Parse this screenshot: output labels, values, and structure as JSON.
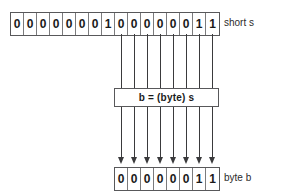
{
  "diagram": {
    "short_row": {
      "label": "short s",
      "bits": [
        "0",
        "0",
        "0",
        "0",
        "0",
        "0",
        "0",
        "1",
        "0",
        "0",
        "0",
        "0",
        "0",
        "0",
        "1",
        "1"
      ]
    },
    "cast_box": {
      "expression": "b = (byte) s"
    },
    "byte_row": {
      "label": "byte b",
      "bits": [
        "0",
        "0",
        "0",
        "0",
        "0",
        "0",
        "1",
        "1"
      ]
    },
    "connectors": {
      "count": 8,
      "source_bit_start_index": 8,
      "arrow_direction": "down"
    },
    "colors": {
      "background": "#ffffff",
      "border": "#58585a",
      "cell_divider": "#7b7b7d",
      "text": "#1a1a1a",
      "label_text": "#2b2b2b",
      "arrow": "#3a3a3c"
    }
  }
}
